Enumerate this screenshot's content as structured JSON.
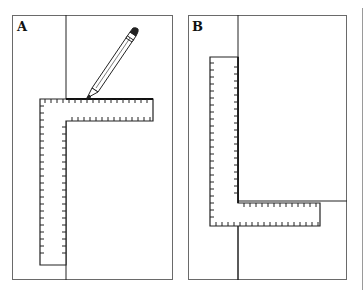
{
  "figure": {
    "panels": [
      {
        "label": "A",
        "elements": [
          "board",
          "vertical-edge-line",
          "carpenters-square-L-ruler",
          "pencil-marking-line"
        ],
        "square_orientation": "corner top-left, arms extend right and down"
      },
      {
        "label": "B",
        "elements": [
          "board",
          "vertical-edge-line",
          "horizontal-marked-line",
          "carpenters-square-L-ruler"
        ],
        "square_orientation": "corner bottom-left, arms extend up and right"
      }
    ]
  },
  "colors": {
    "line": "#222222",
    "frame": "#6a6a6a",
    "background": "#ffffff"
  }
}
